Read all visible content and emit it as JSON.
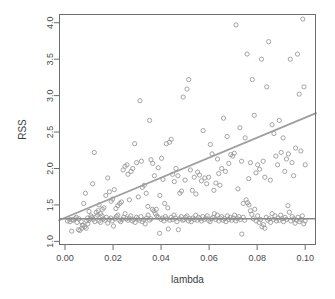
{
  "chart_data": {
    "type": "scatter",
    "title": "",
    "xlabel": "lambda",
    "ylabel": "RSS",
    "xlim": [
      -0.0025,
      0.1045
    ],
    "ylim": [
      0.95,
      4.12
    ],
    "xticks": [
      0.0,
      0.02,
      0.04,
      0.06,
      0.08,
      0.1
    ],
    "xticklabels": [
      "0.00",
      "0.02",
      "0.04",
      "0.06",
      "0.08",
      "0.10"
    ],
    "yticks": [
      1.0,
      1.5,
      2.0,
      2.5,
      3.0,
      3.5,
      4.0
    ],
    "yticklabels": [
      "1.0",
      "1.5",
      "2.0",
      "2.5",
      "3.0",
      "3.5",
      "4.0"
    ],
    "grid": false,
    "legend": null,
    "point_marker": "open-circle",
    "point_color": "#9a9a9a",
    "line_color": "#9e9e9e",
    "hline_color": "#8a8a8a",
    "series": [
      {
        "name": "fan",
        "comment": "spread cloud increasing with lambda",
        "x": [
          0.0021,
          0.0032,
          0.0047,
          0.0058,
          0.007,
          0.0072,
          0.0078,
          0.0085,
          0.009,
          0.0095,
          0.01,
          0.0108,
          0.0115,
          0.0122,
          0.013,
          0.0138,
          0.0142,
          0.0148,
          0.0155,
          0.0162,
          0.017,
          0.0178,
          0.0185,
          0.0192,
          0.0198,
          0.0205,
          0.0212,
          0.022,
          0.0228,
          0.0235,
          0.0242,
          0.025,
          0.0258,
          0.0262,
          0.0268,
          0.0275,
          0.0282,
          0.029,
          0.0298,
          0.0305,
          0.0312,
          0.0318,
          0.0322,
          0.033,
          0.0338,
          0.0345,
          0.0352,
          0.0358,
          0.0365,
          0.0372,
          0.038,
          0.0388,
          0.0395,
          0.0402,
          0.0408,
          0.0415,
          0.0422,
          0.0428,
          0.0435,
          0.0442,
          0.0448,
          0.0455,
          0.0462,
          0.047,
          0.0478,
          0.0485,
          0.0492,
          0.05,
          0.0508,
          0.0515,
          0.0522,
          0.053,
          0.0538,
          0.0545,
          0.0552,
          0.056,
          0.0568,
          0.0575,
          0.0582,
          0.059,
          0.0598,
          0.0605,
          0.0612,
          0.062,
          0.0628,
          0.0635,
          0.064,
          0.0645,
          0.0652,
          0.066,
          0.0668,
          0.0675,
          0.0682,
          0.069,
          0.0698,
          0.0705,
          0.0712,
          0.072,
          0.0728,
          0.0735,
          0.0742,
          0.075,
          0.0758,
          0.0765,
          0.0772,
          0.078,
          0.0788,
          0.0795,
          0.0802,
          0.081,
          0.0818,
          0.0825,
          0.0832,
          0.084,
          0.0848,
          0.0855,
          0.0862,
          0.087,
          0.0878,
          0.0885,
          0.0892,
          0.09,
          0.0908,
          0.0915,
          0.0922,
          0.093,
          0.0938,
          0.0945,
          0.0952,
          0.096,
          0.0968,
          0.0975,
          0.0982,
          0.099,
          0.0995,
          0.1
        ],
        "y": [
          1.27,
          1.3,
          1.33,
          1.31,
          1.18,
          1.22,
          1.52,
          1.66,
          1.28,
          1.24,
          1.41,
          1.35,
          1.79,
          2.22,
          1.4,
          1.42,
          1.5,
          1.38,
          1.44,
          1.46,
          1.63,
          1.87,
          1.68,
          1.55,
          1.58,
          1.71,
          1.45,
          1.49,
          1.52,
          1.54,
          1.98,
          2.03,
          2.05,
          1.92,
          1.57,
          1.96,
          2.0,
          2.34,
          2.08,
          1.61,
          2.93,
          2.1,
          1.74,
          1.77,
          1.66,
          1.48,
          2.66,
          2.12,
          2.07,
          1.9,
          1.44,
          2.01,
          1.63,
          2.14,
          1.85,
          1.52,
          2.34,
          1.46,
          2.36,
          2.4,
          1.92,
          1.82,
          2.0,
          1.9,
          1.66,
          1.69,
          2.98,
          1.84,
          3.09,
          3.22,
          1.98,
          1.7,
          1.88,
          1.65,
          1.95,
          1.91,
          1.83,
          2.52,
          1.87,
          1.79,
          1.88,
          2.33,
          2.2,
          1.7,
          1.8,
          2.13,
          1.93,
          1.77,
          2.0,
          2.69,
          1.96,
          2.44,
          2.07,
          2.19,
          2.17,
          2.21,
          3.97,
          1.72,
          2.56,
          2.1,
          1.52,
          2.42,
          3.57,
          1.86,
          2.08,
          3.22,
          2.73,
          1.94,
          2.05,
          1.99,
          3.5,
          2.1,
          1.88,
          3.12,
          3.74,
          1.84,
          2.6,
          2.48,
          2.17,
          2.05,
          2.66,
          2.22,
          2.42,
          1.96,
          2.13,
          2.2,
          3.5,
          2.08,
          1.9,
          2.28,
          3.57,
          3.02,
          2.24,
          4.05,
          3.12,
          2.05
        ]
      },
      {
        "name": "band",
        "comment": "tight band of points near RSS 1.3",
        "x": [
          0.001,
          0.002,
          0.0028,
          0.0035,
          0.0042,
          0.005,
          0.0056,
          0.0062,
          0.0068,
          0.0075,
          0.0082,
          0.0088,
          0.0094,
          0.01,
          0.0106,
          0.0112,
          0.0118,
          0.0124,
          0.013,
          0.0136,
          0.0142,
          0.0148,
          0.0154,
          0.016,
          0.0166,
          0.0172,
          0.0178,
          0.0184,
          0.019,
          0.0196,
          0.0202,
          0.0208,
          0.0214,
          0.022,
          0.0226,
          0.0232,
          0.0238,
          0.0244,
          0.025,
          0.0256,
          0.0262,
          0.0268,
          0.0274,
          0.028,
          0.0286,
          0.0292,
          0.0298,
          0.0304,
          0.031,
          0.0316,
          0.0322,
          0.0328,
          0.0334,
          0.034,
          0.0346,
          0.0352,
          0.0358,
          0.0364,
          0.037,
          0.0376,
          0.0382,
          0.0388,
          0.0394,
          0.04,
          0.0406,
          0.0412,
          0.0418,
          0.0424,
          0.043,
          0.0436,
          0.0442,
          0.0448,
          0.0454,
          0.046,
          0.0466,
          0.0472,
          0.0478,
          0.0484,
          0.049,
          0.0496,
          0.0502,
          0.0508,
          0.0514,
          0.052,
          0.0526,
          0.0532,
          0.0538,
          0.0544,
          0.055,
          0.0556,
          0.0562,
          0.0568,
          0.0574,
          0.058,
          0.0586,
          0.0592,
          0.0598,
          0.0604,
          0.061,
          0.0616,
          0.0622,
          0.0628,
          0.0634,
          0.064,
          0.0646,
          0.0652,
          0.0658,
          0.0664,
          0.067,
          0.0676,
          0.0682,
          0.0688,
          0.0694,
          0.07,
          0.0706,
          0.0712,
          0.0718,
          0.0724,
          0.073,
          0.0736,
          0.0742,
          0.0748,
          0.0754,
          0.076,
          0.0766,
          0.0772,
          0.0778,
          0.0784,
          0.079,
          0.0796,
          0.0802,
          0.0808,
          0.0814,
          0.082,
          0.0826,
          0.0832,
          0.0838,
          0.0844,
          0.085,
          0.0856,
          0.0862,
          0.0868,
          0.0874,
          0.088,
          0.0886,
          0.0892,
          0.0898,
          0.0904,
          0.091,
          0.0916,
          0.0922,
          0.0928,
          0.0934,
          0.094,
          0.0946,
          0.0952,
          0.0958,
          0.0964,
          0.097,
          0.0976,
          0.0982,
          0.0988,
          0.0994,
          0.1
        ],
        "y": [
          1.28,
          1.3,
          1.14,
          1.29,
          1.31,
          1.26,
          1.16,
          1.15,
          1.27,
          1.22,
          1.2,
          1.18,
          1.32,
          1.29,
          1.31,
          1.33,
          1.3,
          1.27,
          1.34,
          1.36,
          1.28,
          1.26,
          1.35,
          1.31,
          1.29,
          1.33,
          1.25,
          1.3,
          1.32,
          1.28,
          1.21,
          1.31,
          1.34,
          1.36,
          1.29,
          1.27,
          1.3,
          1.33,
          1.38,
          1.31,
          1.29,
          1.32,
          1.35,
          1.28,
          1.3,
          1.26,
          1.33,
          1.31,
          1.29,
          1.34,
          1.27,
          1.3,
          1.24,
          1.32,
          1.36,
          1.29,
          1.31,
          1.44,
          1.42,
          1.38,
          1.35,
          1.33,
          1.11,
          1.3,
          1.32,
          1.28,
          1.34,
          1.31,
          1.17,
          1.29,
          1.33,
          1.3,
          1.36,
          1.32,
          1.27,
          1.16,
          1.31,
          1.34,
          1.29,
          1.3,
          1.33,
          1.35,
          1.28,
          1.31,
          1.27,
          1.32,
          1.3,
          1.36,
          1.29,
          1.33,
          1.31,
          1.28,
          1.34,
          1.3,
          1.32,
          1.35,
          1.29,
          1.27,
          1.31,
          1.33,
          1.38,
          1.3,
          1.36,
          1.28,
          1.32,
          1.34,
          1.29,
          1.31,
          1.27,
          1.35,
          1.3,
          1.33,
          1.29,
          1.32,
          1.36,
          1.28,
          1.31,
          1.34,
          1.3,
          1.1,
          1.33,
          1.29,
          1.57,
          1.53,
          1.5,
          1.42,
          1.37,
          1.31,
          1.44,
          1.28,
          1.35,
          1.26,
          1.3,
          1.2,
          1.23,
          1.18,
          1.33,
          1.29,
          1.31,
          1.26,
          1.38,
          1.3,
          1.35,
          1.28,
          1.32,
          1.29,
          1.36,
          1.31,
          1.27,
          1.33,
          1.3,
          1.49,
          1.4,
          1.28,
          1.34,
          1.31,
          1.25,
          1.29,
          1.33,
          1.27,
          1.3,
          1.35,
          1.24,
          1.28
        ]
      }
    ],
    "lines": [
      {
        "name": "regression-line",
        "type": "segment",
        "x0": -0.0025,
        "y0": 1.29,
        "x1": 0.1045,
        "y1": 2.76,
        "color": "#9e9e9e"
      },
      {
        "name": "reference-hline",
        "type": "hline",
        "y": 1.31,
        "color": "#8a8a8a"
      }
    ]
  }
}
